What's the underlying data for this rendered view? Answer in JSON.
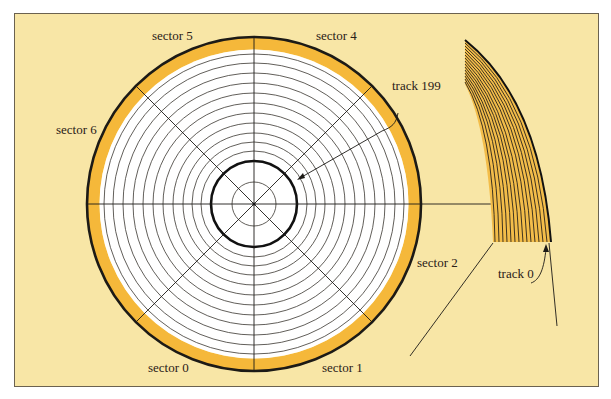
{
  "diagram": {
    "colors": {
      "background": "#f8e6a6",
      "frame": "#5e5440",
      "platter": "#ffffff",
      "sector_ring": "#f5b83a",
      "line": "#1c1a16",
      "track_band": "#f3bd4a"
    },
    "disk": {
      "center": [
        254,
        204
      ],
      "outer_radius": 167,
      "ring_inner_radius": 154,
      "spindle_radius": 22,
      "innermost_track_radius": 43,
      "track_radii": [
        52,
        61,
        70,
        80,
        90,
        100,
        111,
        121,
        132,
        142,
        150
      ],
      "sector_count": 8
    },
    "labels": {
      "sector_0": "sector 0",
      "sector_1": "sector 1",
      "sector_2": "sector 2",
      "sector_4": "sector 4",
      "sector_5": "sector 5",
      "sector_6": "sector 6",
      "track_199": "track 199",
      "track_0": "track 0"
    },
    "detail": {
      "description": "magnified edge of the disk showing outer tracks",
      "track_lines": 16
    }
  }
}
